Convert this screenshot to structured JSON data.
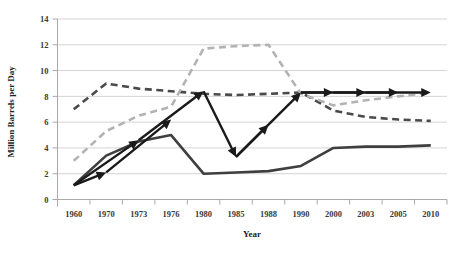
{
  "chart_data": {
    "type": "line",
    "title": "",
    "xlabel": "Year",
    "ylabel": "Million Barrels per Day",
    "categories": [
      "1960",
      "1970",
      "1973",
      "1976",
      "1980",
      "1985",
      "1988",
      "1990",
      "2000",
      "2003",
      "2005",
      "2010"
    ],
    "ylim": [
      0,
      14
    ],
    "ytick_values": [
      "0",
      "2",
      "4",
      "6",
      "8",
      "10",
      "12",
      "14"
    ],
    "grid": "horizontal",
    "legend": "none",
    "series": [
      {
        "name": "solid-dark-series",
        "style": "solid",
        "color": "#3f3f3f",
        "values": [
          1.1,
          3.4,
          4.5,
          5.0,
          2.0,
          2.1,
          2.2,
          2.6,
          4.0,
          4.1,
          4.1,
          4.2
        ]
      },
      {
        "name": "dark-dashed-series",
        "style": "dashed",
        "color": "#4a4a4a",
        "values": [
          7.0,
          9.0,
          8.6,
          8.4,
          8.2,
          8.1,
          8.2,
          8.3,
          6.9,
          6.4,
          6.2,
          6.1
        ]
      },
      {
        "name": "light-gray-dashed-series",
        "style": "dashed",
        "color": "#b3b3b3",
        "values": [
          3.0,
          5.3,
          6.5,
          7.2,
          11.7,
          11.9,
          12.0,
          8.2,
          7.3,
          7.7,
          8.0,
          8.3
        ]
      }
    ],
    "annotations": {
      "name": "trend-arrow-overlay",
      "color": "#1a1a1a",
      "segments": [
        {
          "from_year": "1960",
          "from_value": 1.1,
          "to_year": "1970",
          "to_value": 2.1
        },
        {
          "from_year": "1960",
          "from_value": 1.1,
          "to_year": "1973",
          "to_value": 4.6
        },
        {
          "from_year": "1970",
          "from_value": 2.1,
          "to_year": "1976",
          "to_value": 6.2
        },
        {
          "from_year": "1973",
          "from_value": 4.6,
          "to_year": "1980",
          "to_value": 8.4
        },
        {
          "from_year": "1980",
          "from_value": 8.4,
          "to_year": "1985",
          "to_value": 3.3
        },
        {
          "from_year": "1985",
          "from_value": 3.3,
          "to_year": "1988",
          "to_value": 5.8
        },
        {
          "from_year": "1985",
          "from_value": 3.3,
          "to_year": "1990",
          "to_value": 8.3
        },
        {
          "from_year": "1990",
          "from_value": 8.3,
          "to_year": "2000",
          "to_value": 8.3
        },
        {
          "from_year": "1990",
          "from_value": 8.3,
          "to_year": "2003",
          "to_value": 8.3
        },
        {
          "from_year": "2000",
          "from_value": 8.3,
          "to_year": "2005",
          "to_value": 8.3
        },
        {
          "from_year": "2003",
          "from_value": 8.3,
          "to_year": "2010",
          "to_value": 8.3
        }
      ]
    }
  }
}
